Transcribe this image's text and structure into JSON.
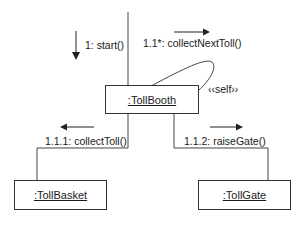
{
  "diagram": {
    "type": "UML collaboration diagram",
    "objects": [
      {
        "id": "tollbooth",
        "label": ":TollBooth"
      },
      {
        "id": "tollbasket",
        "label": ":TollBasket"
      },
      {
        "id": "tollgate",
        "label": ":TollGate"
      }
    ],
    "messages": [
      {
        "label": "1: start()",
        "direction": "down",
        "target": ":TollBooth"
      },
      {
        "label": "1.1*: collectNextToll()",
        "direction": "right",
        "target": ":TollBooth"
      },
      {
        "label": "1.1.1: collectToll()",
        "direction": "left",
        "from": ":TollBooth",
        "target": ":TollBasket"
      },
      {
        "label": "1.1.2: raiseGate()",
        "direction": "right",
        "from": ":TollBooth",
        "target": ":TollGate"
      }
    ],
    "self_link_label": "‹‹self››"
  }
}
